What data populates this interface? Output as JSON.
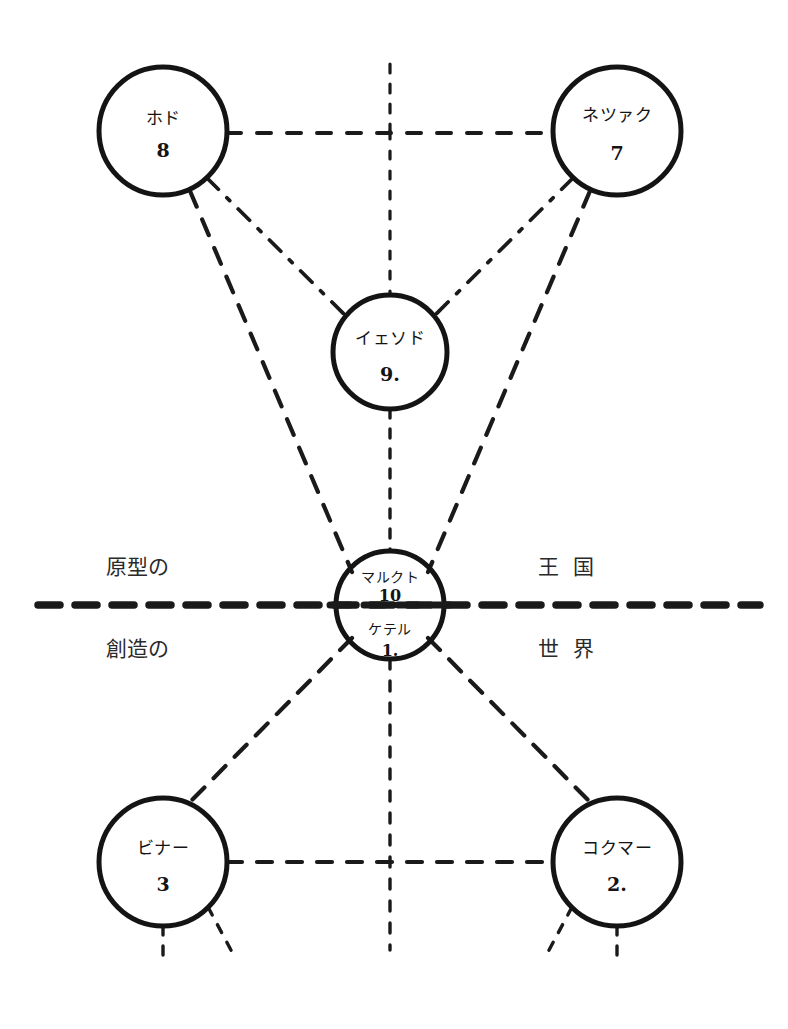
{
  "diagram": {
    "type": "sephiroth-tree",
    "background_color": "#ffffff",
    "ink_color": "#1a1a1a",
    "nodes": [
      {
        "id": "hod",
        "name": "ホド",
        "number": "8",
        "cx": 163,
        "cy": 131,
        "r": 64
      },
      {
        "id": "netzach",
        "name": "ネツァク",
        "number": "7",
        "cx": 617,
        "cy": 131,
        "r": 64
      },
      {
        "id": "yesod",
        "name": "イェソド",
        "number": "9.",
        "cx": 390,
        "cy": 352,
        "r": 57
      },
      {
        "id": "center",
        "name": "マルクト",
        "number": "10",
        "cx": 390,
        "cy": 605,
        "r": 54,
        "name_lower": "ケテル",
        "number_lower": "1."
      },
      {
        "id": "binah",
        "name": "ビナー",
        "number": "3",
        "cx": 163,
        "cy": 862,
        "r": 64
      },
      {
        "id": "chokmah",
        "name": "コクマー",
        "number": "2.",
        "cx": 617,
        "cy": 862,
        "r": 64
      }
    ],
    "world_labels": [
      {
        "id": "upper-left",
        "text": "原型の",
        "x": 137,
        "y": 565,
        "spaced": false
      },
      {
        "id": "upper-right",
        "text": "王国",
        "x": 566,
        "y": 565,
        "spaced": true
      },
      {
        "id": "lower-left",
        "text": "創造の",
        "x": 137,
        "y": 647,
        "spaced": false
      },
      {
        "id": "lower-right",
        "text": "世界",
        "x": 566,
        "y": 647,
        "spaced": true
      }
    ],
    "divider": {
      "id": "horizon-divider",
      "y": 605,
      "x_start": 38,
      "x_end": 760,
      "style": "heavy-dashed"
    },
    "edges": [
      {
        "id": "hod-netzach",
        "from": "hod",
        "to": "netzach"
      },
      {
        "id": "hod-yesod",
        "from": "hod",
        "to": "yesod"
      },
      {
        "id": "netzach-yesod",
        "from": "netzach",
        "to": "yesod"
      },
      {
        "id": "hod-center",
        "from": "hod",
        "to": "center"
      },
      {
        "id": "netzach-center",
        "from": "netzach",
        "to": "center"
      },
      {
        "id": "yesod-center",
        "from": "yesod",
        "to": "center"
      },
      {
        "id": "binah-chokmah",
        "from": "binah",
        "to": "chokmah"
      },
      {
        "id": "binah-center",
        "from": "binah",
        "to": "center"
      },
      {
        "id": "chokmah-center",
        "from": "chokmah",
        "to": "center"
      },
      {
        "id": "center-pillar",
        "from": "center",
        "to": "below"
      }
    ],
    "stubs": [
      {
        "id": "binah-stub-down",
        "from": "binah"
      },
      {
        "id": "binah-stub-diagonal",
        "from": "binah"
      },
      {
        "id": "chokmah-stub-down",
        "from": "chokmah"
      },
      {
        "id": "chokmah-stub-diagonal",
        "from": "chokmah"
      },
      {
        "id": "top-pillar-stub",
        "from": "top"
      }
    ]
  }
}
